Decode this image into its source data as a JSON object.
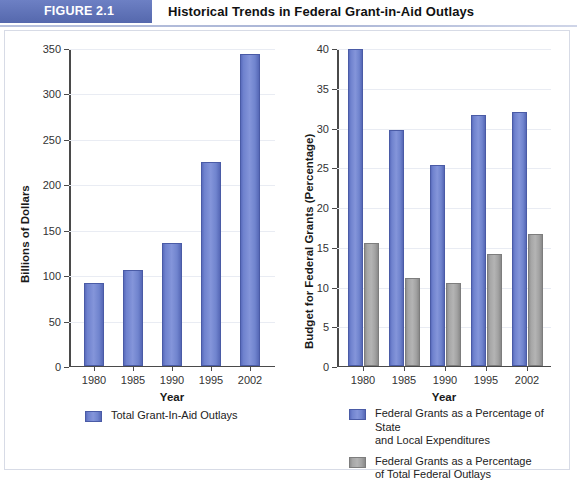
{
  "figure": {
    "badge": "FIGURE 2.1",
    "title": "Historical Trends in Federal Grant-in-Aid Outlays"
  },
  "colors": {
    "badge_bg": "#5c70b8",
    "series_blue": "#7084ce",
    "series_gray": "#a6a6a6",
    "axis": "#4a4a4a",
    "grid": "#e9ecf3"
  },
  "chart_data": [
    {
      "id": "left",
      "type": "bar",
      "title": "",
      "xlabel": "Year",
      "ylabel": "Billions of Dollars",
      "categories": [
        "1980",
        "1985",
        "1990",
        "1995",
        "2002"
      ],
      "ylim": [
        0,
        350
      ],
      "yticks": [
        0,
        50,
        100,
        150,
        200,
        250,
        300,
        350
      ],
      "grid": true,
      "legend_position": "bottom",
      "series": [
        {
          "name": "Total Grant-In-Aid Outlays",
          "color": "#7084ce",
          "values": [
            91,
            106,
            135,
            225,
            345
          ]
        }
      ]
    },
    {
      "id": "right",
      "type": "bar",
      "title": "",
      "xlabel": "Year",
      "ylabel": "Budget for Federal Grants (Percentage)",
      "categories": [
        "1980",
        "1985",
        "1990",
        "1995",
        "2002"
      ],
      "ylim": [
        0,
        40
      ],
      "yticks": [
        0,
        5,
        10,
        15,
        20,
        25,
        30,
        35,
        40
      ],
      "grid": true,
      "legend_position": "bottom",
      "series": [
        {
          "name": "Federal Grants as a Percentage of State and Local Expenditures",
          "name_line1": "Federal Grants as a Percentage of State",
          "name_line2": "and Local Expenditures",
          "color": "#7084ce",
          "values": [
            40.0,
            29.8,
            25.3,
            31.6,
            32.1
          ]
        },
        {
          "name": "Federal Grants as a Percentage of Total Federal Outlays",
          "name_line1": "Federal Grants as a Percentage",
          "name_line2": "of Total Federal Outlays",
          "color": "#a6a6a6",
          "values": [
            15.5,
            11.0,
            10.4,
            14.1,
            16.6
          ]
        }
      ]
    }
  ]
}
